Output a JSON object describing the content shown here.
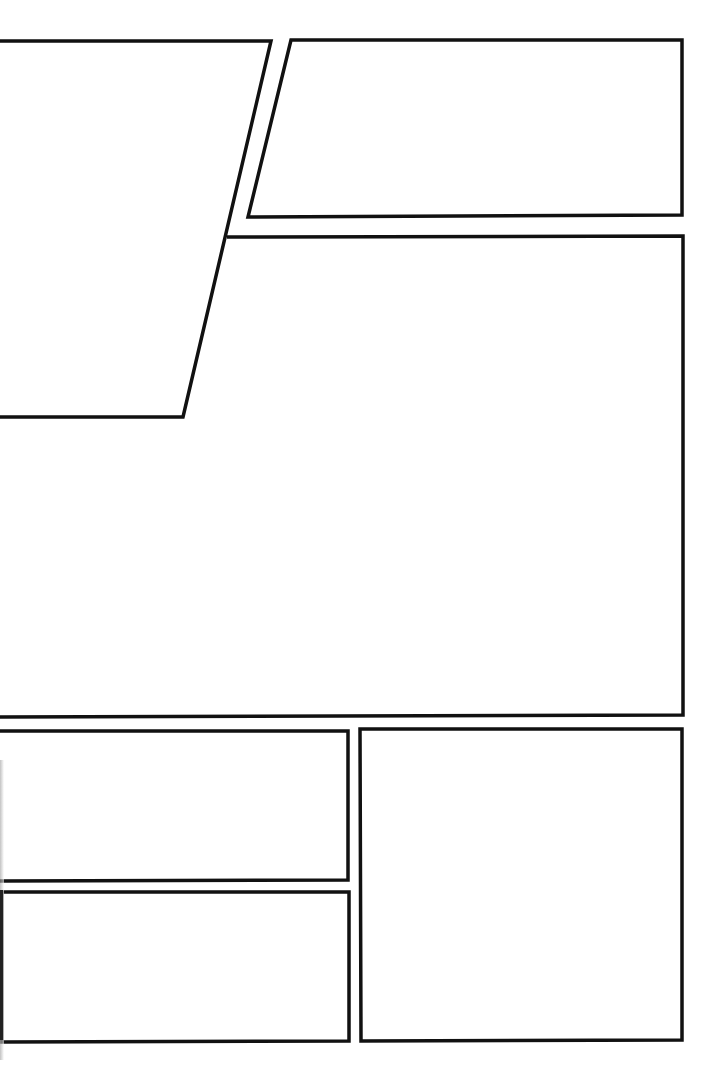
{
  "page": {
    "width": 722,
    "height": 1078,
    "background": "#ffffff",
    "stroke_color": "#111111",
    "stroke_width": 3.5
  },
  "panels": [
    {
      "id": "panel-1",
      "label": "top-left slanted panel",
      "points": [
        [
          0,
          41
        ],
        [
          271,
          41
        ],
        [
          183,
          417
        ],
        [
          0,
          417
        ]
      ],
      "open_left": true
    },
    {
      "id": "panel-2",
      "label": "top-right slanted panel",
      "points": [
        [
          291,
          40
        ],
        [
          682,
          40
        ],
        [
          682,
          215
        ],
        [
          248,
          217
        ]
      ]
    },
    {
      "id": "panel-3",
      "label": "large middle panel",
      "points": [
        [
          227,
          236
        ],
        [
          683,
          236
        ],
        [
          683,
          715
        ],
        [
          0,
          717
        ],
        [
          0,
          417
        ],
        [
          183,
          417
        ]
      ],
      "note": "shares slanted edge under panel 1",
      "path": "M227,237 L683,236 L683,715 L0,717"
    },
    {
      "id": "panel-4",
      "label": "bottom-left upper panel",
      "points": [
        [
          0,
          731
        ],
        [
          348,
          731
        ],
        [
          348,
          880
        ],
        [
          0,
          881
        ]
      ],
      "open_left": true
    },
    {
      "id": "panel-5",
      "label": "bottom-left lower panel",
      "points": [
        [
          2,
          892
        ],
        [
          349,
          892
        ],
        [
          349,
          1041
        ],
        [
          2,
          1042
        ]
      ]
    },
    {
      "id": "panel-6",
      "label": "bottom-right tall panel",
      "points": [
        [
          360,
          729
        ],
        [
          682,
          729
        ],
        [
          682,
          1040
        ],
        [
          361,
          1041
        ]
      ]
    }
  ]
}
